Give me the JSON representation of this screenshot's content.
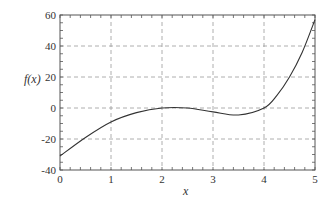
{
  "chart_data": {
    "type": "line",
    "title": "",
    "xlabel": "x",
    "ylabel": "f(x)",
    "xlim": [
      0,
      5
    ],
    "ylim": [
      -40,
      60
    ],
    "grid": true,
    "x_ticks": [
      "0",
      "1",
      "2",
      "3",
      "4",
      "5"
    ],
    "y_ticks": [
      "60",
      "40",
      "20",
      "0",
      "-20",
      "-40"
    ],
    "series": [
      {
        "name": "f(x)",
        "x": [
          0,
          0.5,
          1,
          1.5,
          2,
          2.5,
          3,
          3.5,
          4,
          4.25,
          4.5,
          4.75,
          5
        ],
        "values": [
          -31,
          -19,
          -9,
          -3,
          0,
          0,
          -2.5,
          -4.5,
          0,
          8,
          20,
          36,
          57
        ]
      }
    ]
  }
}
